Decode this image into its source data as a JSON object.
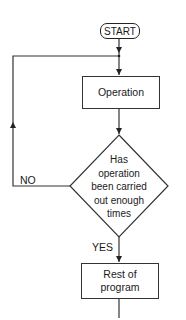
{
  "diagram": {
    "type": "flowchart",
    "nodes": {
      "start": {
        "shape": "terminator",
        "label": "START"
      },
      "operation": {
        "shape": "process",
        "label": "Operation"
      },
      "decision": {
        "shape": "decision",
        "lines": [
          "Has",
          "operation",
          "been carried",
          "out enough",
          "times"
        ]
      },
      "rest": {
        "shape": "process",
        "lines": [
          "Rest of",
          "program"
        ]
      }
    },
    "edges": {
      "no_label": "NO",
      "yes_label": "YES"
    },
    "colors": {
      "stroke": "#333333",
      "text": "#1a1a1a",
      "background": "#ffffff"
    }
  }
}
